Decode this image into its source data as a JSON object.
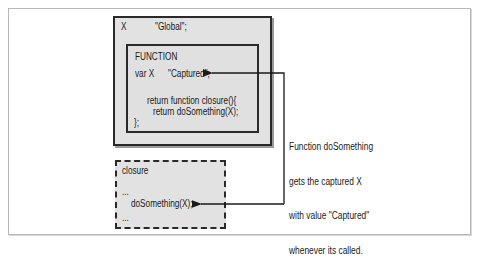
{
  "diagram": {
    "global_scope": {
      "var_name": "X",
      "value": "\"Global\";"
    },
    "function_scope": {
      "title": "FUNCTION",
      "decl_prefix": "var X",
      "decl_value": "\"Captured\";",
      "lines": [
        "return function closure(){",
        "return doSomething(X);",
        "};"
      ]
    },
    "closure_scope": {
      "title": "closure",
      "ellipsis_top": "...",
      "call": "doSomething(X);",
      "ellipsis_bottom": "..."
    },
    "callout": {
      "lines": [
        "Function doSomething",
        "gets the captured X",
        "with value \"Captured\"",
        "whenever its called."
      ]
    },
    "colors": {
      "box_fill": "#e2e2e2",
      "stroke": "#2a2a2a",
      "frame": "#b8b8b8"
    }
  }
}
